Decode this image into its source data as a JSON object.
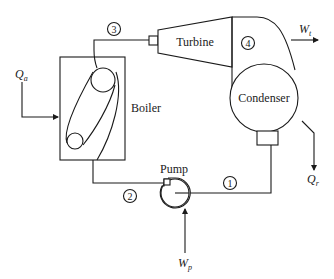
{
  "diagram": {
    "components": {
      "boiler": {
        "label": "Boiler"
      },
      "turbine": {
        "label": "Turbine"
      },
      "condenser": {
        "label": "Condenser"
      },
      "pump": {
        "label": "Pump"
      }
    },
    "states": [
      {
        "id": "1",
        "label": "1",
        "location": "condenser outlet / pump inlet"
      },
      {
        "id": "2",
        "label": "2",
        "location": "pump outlet / boiler inlet"
      },
      {
        "id": "3",
        "label": "3",
        "location": "boiler outlet / turbine inlet"
      },
      {
        "id": "4",
        "label": "4",
        "location": "turbine exhaust / condenser inlet"
      }
    ],
    "energy_flows": {
      "heat_added": {
        "symbol": "Q",
        "subscript": "a",
        "direction": "into boiler"
      },
      "turbine_work": {
        "symbol": "W",
        "subscript": "t",
        "direction": "out of turbine"
      },
      "heat_rejected": {
        "symbol": "Q",
        "subscript": "r",
        "direction": "out of condenser"
      },
      "pump_work": {
        "symbol": "W",
        "subscript": "p",
        "direction": "into pump"
      }
    },
    "colors": {
      "line": "#1a1a1a",
      "background": "#ffffff"
    }
  }
}
